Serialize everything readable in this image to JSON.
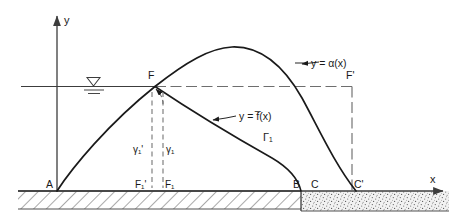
{
  "figure": {
    "kind": "engineering-diagram"
  },
  "axes": {
    "x_label": "x",
    "y_label": "y"
  },
  "curve_labels": {
    "alpha": "y = α(x)",
    "fbar": "y = f̅(x)",
    "gamma_curve": "Γ₁"
  },
  "points": {
    "a": "A",
    "f": "F",
    "f_prime": "F'",
    "b": "B",
    "c": "C",
    "c_prime": "C'",
    "f1_prime": "F₁'",
    "f1": "F₁"
  },
  "ordinates": {
    "gamma1_prime": "γ₁'",
    "gamma1": "γ₁"
  },
  "symbols": {
    "water_table": "water-table-symbol"
  },
  "colors": {
    "ink": "#1a1a1a",
    "line": "#3c3c3c",
    "dash": "#6e6e6e",
    "hatch": "#555555",
    "sand_fill": "#efefef",
    "sand_speck": "#6a6a6a"
  }
}
